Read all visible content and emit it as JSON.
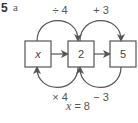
{
  "question": {
    "number": "5",
    "part": "a"
  },
  "boxes": [
    {
      "label": "x",
      "italic": true
    },
    {
      "label": "2",
      "italic": false
    },
    {
      "label": "5",
      "italic": false
    }
  ],
  "forward_ops": [
    {
      "from": 0,
      "to": 1,
      "label": "÷ 4"
    },
    {
      "from": 1,
      "to": 2,
      "label": "+ 3"
    }
  ],
  "inverse_ops": [
    {
      "from": 1,
      "to": 0,
      "label": "× 4"
    },
    {
      "from": 2,
      "to": 1,
      "label": "− 3"
    }
  ],
  "answer": {
    "variable": "x",
    "text": " = 8"
  },
  "colors": {
    "stroke": "#555555",
    "text": "#444444"
  }
}
